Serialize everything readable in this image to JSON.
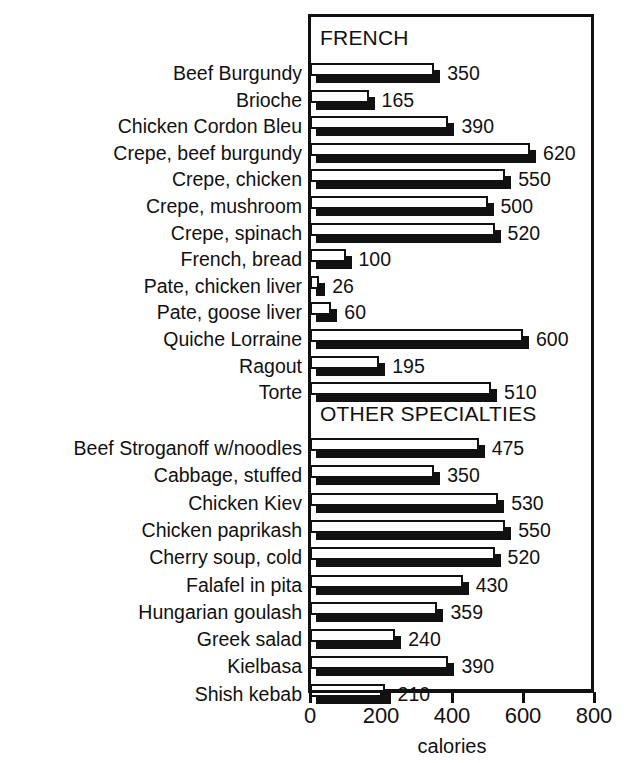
{
  "chart_data": {
    "type": "bar",
    "orientation": "horizontal",
    "title": "",
    "xlabel": "calories",
    "ylabel": "",
    "xlim": [
      0,
      800
    ],
    "xticks": [
      0,
      200,
      400,
      600,
      800
    ],
    "xticklabels": [
      "0",
      "200",
      "400",
      "600",
      "800"
    ],
    "grid": false,
    "legend": null,
    "value_labels": true,
    "bar_style": "white-fill-black-outline-with-drop-shadow",
    "groups": [
      {
        "name": "FRENCH",
        "categories": [
          "Beef Burgundy",
          "Brioche",
          "Chicken Cordon Bleu",
          "Crepe, beef burgundy",
          "Crepe, chicken",
          "Crepe, mushroom",
          "Crepe, spinach",
          "French, bread",
          "Pate, chicken liver",
          "Pate, goose liver",
          "Quiche Lorraine",
          "Ragout",
          "Torte"
        ],
        "values": [
          350,
          165,
          390,
          620,
          550,
          500,
          520,
          100,
          26,
          60,
          600,
          195,
          510
        ]
      },
      {
        "name": "OTHER SPECIALTIES",
        "categories": [
          "Beef Stroganoff w/noodles",
          "Cabbage, stuffed",
          "Chicken Kiev",
          "Chicken paprikash",
          "Cherry soup, cold",
          "Falafel in pita",
          "Hungarian goulash",
          "Greek salad",
          "Kielbasa",
          "Shish kebab"
        ],
        "values": [
          475,
          350,
          530,
          550,
          520,
          430,
          359,
          240,
          390,
          210
        ]
      }
    ]
  },
  "colors": {
    "ink": "#111111",
    "paper": "#ffffff",
    "bar_face": "#ffffff",
    "bar_shadow": "#111111"
  }
}
